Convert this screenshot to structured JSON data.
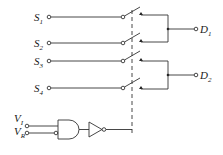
{
  "diagram": {
    "type": "analog multiplexer / switch circuit",
    "inputs": [
      {
        "name": "S",
        "sub": "1"
      },
      {
        "name": "S",
        "sub": "2"
      },
      {
        "name": "S",
        "sub": "3"
      },
      {
        "name": "S",
        "sub": "4"
      }
    ],
    "outputs": [
      {
        "name": "D",
        "sub": "1"
      },
      {
        "name": "D",
        "sub": "2"
      }
    ],
    "control_inputs": [
      {
        "name": "V",
        "sub": "I"
      },
      {
        "name": "V",
        "sub": "R"
      }
    ],
    "gates": [
      "AND gate (inverted V_R input)",
      "inverting buffer"
    ],
    "colors": {
      "line": "#333333",
      "background": "#ffffff"
    }
  }
}
